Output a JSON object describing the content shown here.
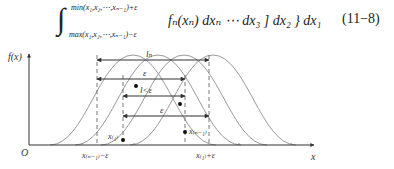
{
  "formula": {
    "integral_sign": "∫",
    "upper_limit": "min(x₁,x₂,⋯,xₙ₋₁)+ε",
    "lower_limit": "max(x₁,x₂,⋯,xₙ₋₁)−ε",
    "integrand": "fₙ(xₙ) dxₙ ⋯ dx₃ ] dx₂ } dx₁",
    "equation_number": "(11−8)"
  },
  "diagram": {
    "y_axis_label": "f(x)",
    "x_axis_label": "x",
    "origin_label": "O",
    "width_label": "lₙ",
    "epsilon_label_1": "ε",
    "less_than_label": "l<ε",
    "epsilon_label_2": "ε",
    "min_point_label": "x₍₁₎",
    "max_point_label": "x₍ₙ₋₁₎",
    "left_tick_label": "x₍ₙ₋₁₎−ε",
    "right_tick_label": "x₍₁₎+ε",
    "curve_count": 4,
    "curve_peaks_x": [
      133,
      158,
      184,
      213
    ],
    "dashed_lines_x": [
      97,
      123,
      185,
      209
    ],
    "line_color": "#9a9a9a",
    "axis_color": "#333333"
  }
}
